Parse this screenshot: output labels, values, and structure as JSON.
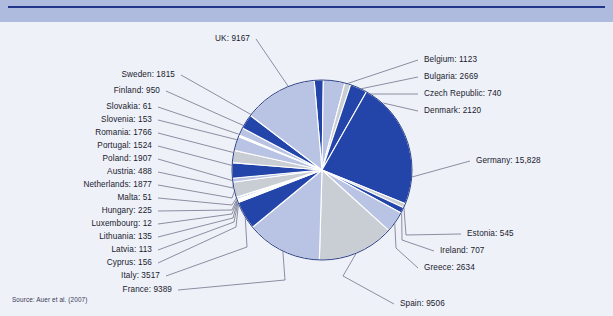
{
  "header": {
    "band_color": "#aebbdf",
    "rule_color": "#22378c"
  },
  "panel": {
    "background_color": "#eef1f8"
  },
  "source_note": "Source: Auer et al. (2007)",
  "chart_data": {
    "type": "pie",
    "title": "",
    "subtitle": "",
    "xlabel": "",
    "ylabel": "",
    "legend_position": "none",
    "grid": false,
    "label_format": "{name}: {value}",
    "total": 68327,
    "start_angle_deg": -5,
    "direction": "clockwise",
    "palette": [
      "#2344a8",
      "#b9c3e4",
      "#c9cdd4"
    ],
    "center": {
      "cx": 322,
      "cy": 148,
      "r": 90
    },
    "categories": [
      "Belgium",
      "Bulgaria",
      "Czech Republic",
      "Denmark",
      "Germany",
      "Estonia",
      "Ireland",
      "Greece",
      "Spain",
      "France",
      "Italy",
      "Cyprus",
      "Latvia",
      "Lithuania",
      "Luxembourg",
      "Hungary",
      "Malta",
      "Netherlands",
      "Austria",
      "Poland",
      "Portugal",
      "Romania",
      "Slovenia",
      "Slovakia",
      "Finland",
      "Sweden",
      "UK"
    ],
    "values": [
      1123,
      2669,
      740,
      2120,
      15828,
      545,
      707,
      2634,
      9506,
      9389,
      3517,
      156,
      113,
      135,
      12,
      225,
      51,
      1877,
      488,
      1907,
      1524,
      1766,
      153,
      61,
      950,
      1815,
      9167
    ],
    "value_labels": [
      "1123",
      "2669",
      "740",
      "2120",
      "15,828",
      "545",
      "707",
      "2634",
      "9506",
      "9389",
      "3517",
      "156",
      "113",
      "135",
      "12",
      "225",
      "51",
      "1877",
      "488",
      "1907",
      "1524",
      "1766",
      "153",
      "61",
      "950",
      "1815",
      "9167"
    ],
    "slices": [
      {
        "name": "Belgium",
        "value": 1123,
        "label": "Belgium: 1123",
        "color": "#2344a8",
        "side": "right",
        "lx": 424,
        "ly": 33,
        "ax": 346,
        "ay": 62
      },
      {
        "name": "Bulgaria",
        "value": 2669,
        "label": "Bulgaria: 2669",
        "color": "#b9c3e4",
        "side": "right",
        "lx": 424,
        "ly": 50,
        "ax": 355,
        "ay": 68
      },
      {
        "name": "Czech Republic",
        "value": 740,
        "label": "Czech Republic: 740",
        "color": "#c9cdd4",
        "side": "right",
        "lx": 424,
        "ly": 67,
        "ax": 363,
        "ay": 72
      },
      {
        "name": "Denmark",
        "value": 2120,
        "label": "Denmark: 2120",
        "color": "#2344a8",
        "side": "right",
        "lx": 424,
        "ly": 84,
        "ax": 370,
        "ay": 78
      },
      {
        "name": "Germany",
        "value": 15828,
        "label": "Germany: 15,828",
        "color": "#2344a8",
        "side": "right",
        "lx": 476,
        "ly": 134,
        "ax": 412,
        "ay": 155
      },
      {
        "name": "Estonia",
        "value": 545,
        "label": "Estonia: 545",
        "color": "#c9cdd4",
        "side": "right",
        "lx": 467,
        "ly": 207,
        "ax": 406,
        "ay": 213
      },
      {
        "name": "Ireland",
        "value": 707,
        "label": "Ireland: 707",
        "color": "#2344a8",
        "side": "right",
        "lx": 440,
        "ly": 224,
        "ax": 402,
        "ay": 218
      },
      {
        "name": "Greece",
        "value": 2634,
        "label": "Greece: 2634",
        "color": "#b9c3e4",
        "side": "right",
        "lx": 424,
        "ly": 241,
        "ax": 396,
        "ay": 226
      },
      {
        "name": "Spain",
        "value": 9506,
        "label": "Spain: 9506",
        "color": "#c9cdd4",
        "side": "right",
        "lx": 400,
        "ly": 277,
        "ax": 343,
        "ay": 254
      },
      {
        "name": "France",
        "value": 9389,
        "label": "France: 9389",
        "color": "#b9c3e4",
        "side": "left",
        "lx": 172,
        "ly": 263,
        "ax": 285,
        "ay": 258
      },
      {
        "name": "Italy",
        "value": 3517,
        "label": "Italy: 3517",
        "color": "#2344a8",
        "side": "left",
        "lx": 160,
        "ly": 249,
        "ax": 247,
        "ay": 225
      },
      {
        "name": "Cyprus",
        "value": 156,
        "label": "Cyprus: 156",
        "color": "#c9cdd4",
        "side": "left",
        "lx": 152,
        "ly": 236,
        "ax": 236,
        "ay": 205
      },
      {
        "name": "Latvia",
        "value": 113,
        "label": "Latvia: 113",
        "color": "#b9c3e4",
        "side": "left",
        "lx": 152,
        "ly": 223,
        "ax": 234,
        "ay": 200
      },
      {
        "name": "Lithuania",
        "value": 135,
        "label": "Lithuania: 135",
        "color": "#2344a8",
        "side": "left",
        "lx": 152,
        "ly": 210,
        "ax": 233,
        "ay": 196
      },
      {
        "name": "Luxembourg",
        "value": 12,
        "label": "Luxembourg: 12",
        "color": "#c9cdd4",
        "side": "left",
        "lx": 152,
        "ly": 197,
        "ax": 232,
        "ay": 192
      },
      {
        "name": "Hungary",
        "value": 225,
        "label": "Hungary: 225",
        "color": "#b9c3e4",
        "side": "left",
        "lx": 152,
        "ly": 184,
        "ax": 232,
        "ay": 188
      },
      {
        "name": "Malta",
        "value": 51,
        "label": "Malta: 51",
        "color": "#2344a8",
        "side": "left",
        "lx": 152,
        "ly": 171,
        "ax": 232,
        "ay": 183
      },
      {
        "name": "Netherlands",
        "value": 1877,
        "label": "Netherlands: 1877",
        "color": "#c9cdd4",
        "side": "left",
        "lx": 152,
        "ly": 158,
        "ax": 232,
        "ay": 176
      },
      {
        "name": "Austria",
        "value": 488,
        "label": "Austria: 488",
        "color": "#b9c3e4",
        "side": "left",
        "lx": 152,
        "ly": 145,
        "ax": 233,
        "ay": 166
      },
      {
        "name": "Poland",
        "value": 1907,
        "label": "Poland: 1907",
        "color": "#2344a8",
        "side": "left",
        "lx": 152,
        "ly": 132,
        "ax": 234,
        "ay": 159
      },
      {
        "name": "Portugal",
        "value": 1524,
        "label": "Portugal: 1524",
        "color": "#c9cdd4",
        "side": "left",
        "lx": 152,
        "ly": 119,
        "ax": 238,
        "ay": 145
      },
      {
        "name": "Romania",
        "value": 1766,
        "label": "Romania: 1766",
        "color": "#b9c3e4",
        "side": "left",
        "lx": 152,
        "ly": 106,
        "ax": 243,
        "ay": 133
      },
      {
        "name": "Slovenia",
        "value": 153,
        "label": "Slovenia: 153",
        "color": "#2344a8",
        "side": "left",
        "lx": 152,
        "ly": 93,
        "ax": 250,
        "ay": 121
      },
      {
        "name": "Slovakia",
        "value": 61,
        "label": "Slovakia: 61",
        "color": "#c9cdd4",
        "side": "left",
        "lx": 152,
        "ly": 80,
        "ax": 253,
        "ay": 117
      },
      {
        "name": "Finland",
        "value": 950,
        "label": "Finland: 950",
        "color": "#b9c3e4",
        "side": "left",
        "lx": 160,
        "ly": 64,
        "ax": 258,
        "ay": 110
      },
      {
        "name": "Sweden",
        "value": 1815,
        "label": "Sweden: 1815",
        "color": "#2344a8",
        "side": "left",
        "lx": 175,
        "ly": 48,
        "ax": 266,
        "ay": 101
      },
      {
        "name": "UK",
        "value": 9167,
        "label": "UK: 9167",
        "color": "#b9c3e4",
        "side": "left",
        "lx": 250,
        "ly": 12,
        "ax": 288,
        "ay": 64
      }
    ]
  }
}
